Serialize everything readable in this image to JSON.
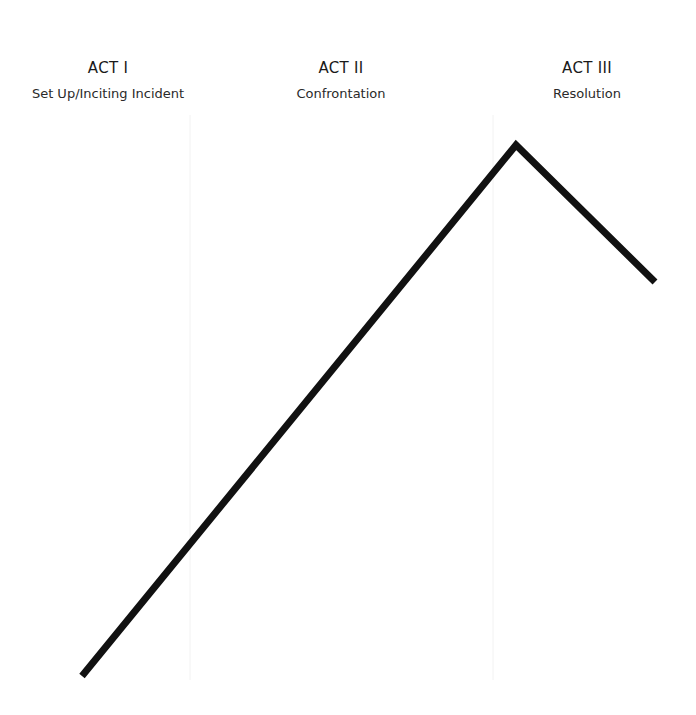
{
  "acts": [
    {
      "title": "ACT I",
      "subtitle": "Set Up/Inciting Incident",
      "center_x": 108
    },
    {
      "title": "ACT II",
      "subtitle": "Confrontation",
      "center_x": 341
    },
    {
      "title": "ACT III",
      "subtitle": "Resolution",
      "center_x": 587
    }
  ],
  "dividers": [
    {
      "x": 190,
      "y1": 115,
      "y2": 680
    },
    {
      "x": 493,
      "y1": 115,
      "y2": 680
    }
  ],
  "story_arc": {
    "points": [
      [
        82,
        676
      ],
      [
        516,
        145
      ],
      [
        655,
        282
      ]
    ],
    "color": "#111111",
    "stroke_width": 7
  },
  "colors": {
    "background": "#ffffff",
    "divider": "#f2f2f2",
    "text": "#1a1a1a"
  }
}
